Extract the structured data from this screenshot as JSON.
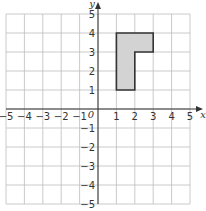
{
  "diagram": {
    "type": "coordinate-grid",
    "x_axis": {
      "label": "x",
      "min": -5,
      "max": 5,
      "ticks": [
        "-5",
        "-4",
        "-3",
        "-2",
        "-1",
        "1",
        "2",
        "3",
        "4",
        "5"
      ]
    },
    "y_axis": {
      "label": "y",
      "min": -5,
      "max": 5,
      "ticks_positive": [
        "1",
        "2",
        "3",
        "4",
        "5"
      ],
      "ticks_negative": [
        "-1",
        "-2",
        "-3",
        "-4",
        "-5"
      ]
    },
    "origin_label": "0",
    "shape": {
      "name": "L-shape",
      "vertices": [
        [
          1,
          1
        ],
        [
          1,
          4
        ],
        [
          3,
          4
        ],
        [
          3,
          3
        ],
        [
          2,
          3
        ],
        [
          2,
          1
        ]
      ],
      "fill": "#d3d3d3",
      "stroke": "#333333"
    },
    "colors": {
      "grid": "#bdbdbd",
      "axis": "#333333",
      "background": "#ffffff"
    }
  }
}
